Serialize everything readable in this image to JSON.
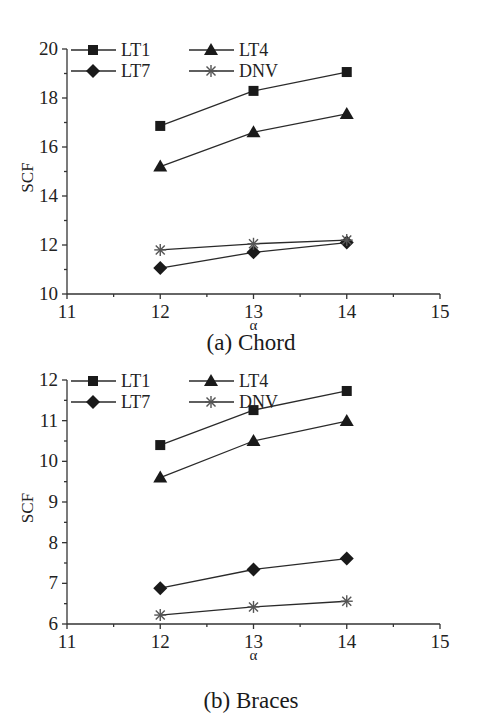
{
  "chart_data": [
    {
      "id": "a",
      "type": "line",
      "title": "(a) Chord",
      "xlabel": "α",
      "ylabel": "SCF",
      "x": [
        12,
        13,
        14
      ],
      "xlim": [
        11,
        15
      ],
      "ylim": [
        10,
        20
      ],
      "xticks": [
        11,
        12,
        13,
        14,
        15
      ],
      "yticks": [
        10,
        12,
        14,
        16,
        18,
        20
      ],
      "grid": false,
      "legend_position": "top-left, 2 columns",
      "series": [
        {
          "name": "LT1",
          "marker": "square",
          "values": [
            16.86,
            18.29,
            19.06
          ]
        },
        {
          "name": "LT4",
          "marker": "triangle",
          "values": [
            15.2,
            16.6,
            17.35
          ]
        },
        {
          "name": "LT7",
          "marker": "diamond",
          "values": [
            11.06,
            11.7,
            12.1
          ]
        },
        {
          "name": "DNV",
          "marker": "asterisk",
          "values": [
            11.8,
            12.05,
            12.2
          ]
        }
      ]
    },
    {
      "id": "b",
      "type": "line",
      "title": "(b) Braces",
      "xlabel": "α",
      "ylabel": "SCF",
      "x": [
        12,
        13,
        14
      ],
      "xlim": [
        11,
        15
      ],
      "ylim": [
        6,
        12
      ],
      "xticks": [
        11,
        12,
        13,
        14,
        15
      ],
      "yticks": [
        6,
        7,
        8,
        9,
        10,
        11,
        12
      ],
      "grid": false,
      "legend_position": "top-left, 2 columns",
      "series": [
        {
          "name": "LT1",
          "marker": "square",
          "values": [
            10.4,
            11.26,
            11.73
          ]
        },
        {
          "name": "LT4",
          "marker": "triangle",
          "values": [
            9.6,
            10.5,
            10.99
          ]
        },
        {
          "name": "LT7",
          "marker": "diamond",
          "values": [
            6.88,
            7.34,
            7.61
          ]
        },
        {
          "name": "DNV",
          "marker": "asterisk",
          "values": [
            6.22,
            6.42,
            6.56
          ]
        }
      ]
    }
  ],
  "colors": {
    "line": "#2a2a2a",
    "marker": "#1a1a1a",
    "dnv_marker": "#555555",
    "axis": "#333333"
  }
}
